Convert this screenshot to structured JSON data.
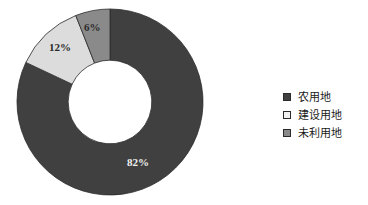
{
  "chart_data": {
    "type": "pie",
    "variant": "donut",
    "title": "",
    "subtitle": "",
    "xlabel": "",
    "ylabel": "",
    "grid": false,
    "legend_position": "right",
    "hole_ratio": 0.45,
    "start_angle_deg": 0,
    "direction": "clockwise",
    "categories": [
      "农用地",
      "建设用地",
      "未利用地"
    ],
    "values": [
      82,
      12,
      6
    ],
    "unit": "%",
    "data_labels": [
      "82%",
      "12%",
      "6%"
    ],
    "colors": [
      "#404040",
      "#dcdcdc",
      "#8a8a8a"
    ],
    "slices": [
      {
        "label": "农用地",
        "value": 82,
        "data_label": "82%",
        "color": "#404040",
        "label_color": "#f2f2f2"
      },
      {
        "label": "建设用地",
        "value": 12,
        "data_label": "12%",
        "color": "#dcdcdc",
        "label_color": "#2a2a2a"
      },
      {
        "label": "未利用地",
        "value": 6,
        "data_label": "6%",
        "color": "#8a8a8a",
        "label_color": "#2a2a2a"
      }
    ]
  },
  "legend": {
    "items": [
      {
        "label": "农用地",
        "swatch_color": "#404040",
        "swatch_border": "#2b2b2b"
      },
      {
        "label": "建设用地",
        "swatch_color": "#f2f2f2",
        "swatch_border": "#2b2b2b"
      },
      {
        "label": "未利用地",
        "swatch_color": "#8a8a8a",
        "swatch_border": "#2b2b2b"
      }
    ]
  },
  "colors": {
    "background": "#ffffff",
    "slice_agricultural": "#404040",
    "slice_construction": "#dcdcdc",
    "slice_unused": "#8a8a8a",
    "outline": "#2b2b2b",
    "text": "#1a1a1a"
  }
}
